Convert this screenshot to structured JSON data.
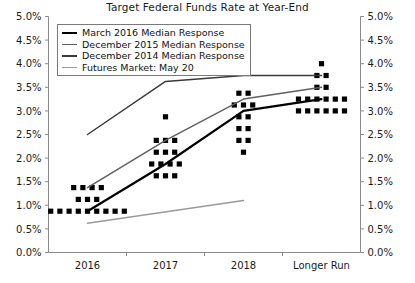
{
  "chart_data": {
    "type": "line",
    "title": "Target Federal Funds Rate at Year-End",
    "xlabel": "",
    "ylabel": "",
    "categories": [
      "2016",
      "2017",
      "2018",
      "Longer Run"
    ],
    "ylim": [
      0.0,
      5.0
    ],
    "ytick_labels": [
      "0.0%",
      "0.5%",
      "1.0%",
      "1.5%",
      "2.0%",
      "2.5%",
      "3.0%",
      "3.5%",
      "4.0%",
      "4.5%",
      "5.0%"
    ],
    "ytick_values": [
      0.0,
      0.5,
      1.0,
      1.5,
      2.0,
      2.5,
      3.0,
      3.5,
      4.0,
      4.5,
      5.0
    ],
    "y_axis_both_sides": true,
    "grid": false,
    "legend_position": "top-left",
    "series": [
      {
        "name": "March 2016 Median Response",
        "color": "#000000",
        "width": 2.2,
        "x": [
          "2016",
          "2017",
          "2018",
          "Longer Run"
        ],
        "values": [
          0.875,
          1.875,
          3.0,
          3.25
        ]
      },
      {
        "name": "December 2015 Median Response",
        "color": "#606060",
        "width": 1.5,
        "x": [
          "2016",
          "2017",
          "2018",
          "Longer Run"
        ],
        "values": [
          1.375,
          2.375,
          3.25,
          3.5
        ]
      },
      {
        "name": "December 2014 Median Response",
        "color": "#3a3a3a",
        "width": 1.5,
        "x": [
          "2016",
          "2017",
          "2018",
          "Longer Run"
        ],
        "values": [
          2.5,
          3.625,
          3.75,
          3.75
        ]
      },
      {
        "name": "Futures Market: May 20",
        "color": "#9a9a9a",
        "width": 1.5,
        "x": [
          "2016",
          "2018"
        ],
        "values": [
          0.62,
          1.1
        ]
      }
    ],
    "scatter": {
      "name": "FOMC participant projections",
      "color": "#000000",
      "marker": "square",
      "size": 2.6,
      "groups": [
        {
          "category": "2016",
          "points": [
            {
              "value": 1.375,
              "count": 4
            },
            {
              "value": 1.125,
              "count": 3
            },
            {
              "value": 0.875,
              "count": 9
            }
          ]
        },
        {
          "category": "2017",
          "points": [
            {
              "value": 2.875,
              "count": 1
            },
            {
              "value": 2.375,
              "count": 3
            },
            {
              "value": 2.125,
              "count": 3
            },
            {
              "value": 1.875,
              "count": 4
            },
            {
              "value": 1.625,
              "count": 3
            }
          ]
        },
        {
          "category": "2018",
          "points": [
            {
              "value": 3.875,
              "count": 1
            },
            {
              "value": 3.375,
              "count": 2
            },
            {
              "value": 3.125,
              "count": 3
            },
            {
              "value": 2.875,
              "count": 2
            },
            {
              "value": 2.625,
              "count": 2
            },
            {
              "value": 2.375,
              "count": 2
            },
            {
              "value": 2.125,
              "count": 1
            }
          ]
        },
        {
          "category": "Longer Run",
          "points": [
            {
              "value": 4.0,
              "count": 1
            },
            {
              "value": 3.75,
              "count": 2
            },
            {
              "value": 3.5,
              "count": 2
            },
            {
              "value": 3.25,
              "count": 6
            },
            {
              "value": 3.0,
              "count": 6
            }
          ]
        }
      ]
    }
  },
  "legend": {
    "items": [
      {
        "label": "March 2016 Median Response",
        "color": "#000000",
        "thickness": "2.5px"
      },
      {
        "label": "December 2015 Median Response",
        "color": "#606060",
        "thickness": "1.6px"
      },
      {
        "label": "December 2014 Median Response",
        "color": "#3a3a3a",
        "thickness": "1.6px"
      },
      {
        "label": "Futures Market: May 20",
        "color": "#9a9a9a",
        "thickness": "1.6px"
      }
    ]
  }
}
